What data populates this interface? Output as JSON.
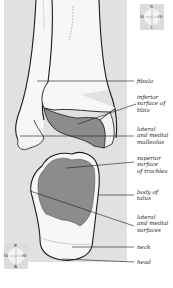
{
  "figure": {
    "colors": {
      "background": "#ffffff",
      "panel": "#e1e1e1",
      "bone": "#f7f7f7",
      "articular_surface": "#8c8c8c",
      "outline": "#1a1a1a"
    }
  },
  "compass_top": {
    "top": "S",
    "bottom": "I",
    "left": "lo",
    "right": "m"
  },
  "compass_bottom": {
    "top": "P",
    "bottom": "A",
    "left": "lo",
    "right": "m"
  },
  "labels": [
    {
      "id": "fibula",
      "text": "fibula"
    },
    {
      "id": "inferior-surface-of-tibia",
      "text": "inferior\nsurface of\ntibia"
    },
    {
      "id": "lateral-and-medial-malleolus",
      "text": "lateral\nand medial\nmalleolus"
    },
    {
      "id": "superior-surface-of-trochlea",
      "text": "superior\nsurface\nof trochlea"
    },
    {
      "id": "body-of-talus",
      "text": "body of\ntalus"
    },
    {
      "id": "lateral-and-medial-surfaces",
      "text": "lateral\nand medial\nsurfaces"
    },
    {
      "id": "neck",
      "text": "neck"
    },
    {
      "id": "head",
      "text": "head"
    }
  ]
}
